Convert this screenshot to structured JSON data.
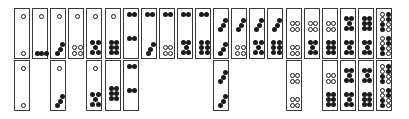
{
  "colors": {
    "pip_black": "#1a1a1a",
    "border": "#3a3a3a",
    "background": "#ffffff"
  },
  "layout": {
    "x0": 14,
    "pitch": 18.1,
    "top_row_y": 8,
    "bottom_row_y": 60,
    "tile_width": 16,
    "tile_height": 51
  },
  "top_row": [
    {
      "col": 0,
      "top": "1w",
      "bottom": "1w"
    },
    {
      "col": 1,
      "top": "1w",
      "bottom": "3b-row"
    },
    {
      "col": 2,
      "top": "1w",
      "bottom": "3b-diag"
    },
    {
      "col": 3,
      "top": "1w",
      "bottom": "4w"
    },
    {
      "col": 4,
      "top": "1w",
      "bottom": "5b"
    },
    {
      "col": 5,
      "top": "1w",
      "bottom": "6b"
    },
    {
      "col": 6,
      "top": "2b",
      "bottom": "2b"
    },
    {
      "col": 7,
      "top": "2b",
      "bottom": "3b-diag"
    },
    {
      "col": 8,
      "top": "2b",
      "bottom": "4w"
    },
    {
      "col": 9,
      "top": "2b",
      "bottom": "5b"
    },
    {
      "col": 10,
      "top": "2b",
      "bottom": "6b"
    },
    {
      "col": 11,
      "top": "3b-diag",
      "bottom": "3b-diag"
    },
    {
      "col": 12,
      "top": "3b-diag",
      "bottom": "4w"
    },
    {
      "col": 13,
      "top": "3b-diag",
      "bottom": "5b"
    },
    {
      "col": 14,
      "top": "3b-diag",
      "bottom": "6b"
    },
    {
      "col": 15,
      "top": "4w",
      "bottom": "4w"
    },
    {
      "col": 16,
      "top": "4w",
      "bottom": "5b"
    },
    {
      "col": 17,
      "top": "4w",
      "bottom": "6b"
    },
    {
      "col": 18,
      "top": "5b",
      "bottom": "5b"
    },
    {
      "col": 19,
      "top": "6b",
      "bottom": "5b"
    },
    {
      "col": 20,
      "top": "6mix",
      "bottom": "6mix"
    }
  ],
  "bottom_row": [
    {
      "col": 0,
      "top": "1w",
      "bottom": "1w"
    },
    {
      "col": 2,
      "top": "1w",
      "bottom": "3b-diag"
    },
    {
      "col": 4,
      "top": "1w",
      "bottom": "5b"
    },
    {
      "col": 5,
      "top": "none",
      "bottom": "6b-mid"
    },
    {
      "col": 6,
      "top": "2b",
      "bottom": "2b"
    },
    {
      "col": 11,
      "top": "3b-diag",
      "bottom": "3b-diag"
    },
    {
      "col": 15,
      "top": "4w",
      "bottom": "4w"
    },
    {
      "col": 17,
      "top": "4w",
      "bottom": "6b"
    },
    {
      "col": 18,
      "top": "5b",
      "bottom": "5b"
    },
    {
      "col": 19,
      "top": "5b",
      "bottom": "6b"
    },
    {
      "col": 20,
      "top": "6mix",
      "bottom": "6mix"
    }
  ]
}
